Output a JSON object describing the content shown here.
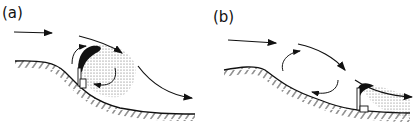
{
  "figure": {
    "panels": [
      {
        "id": "a",
        "label": "(a)",
        "description": "Stack on hillside upwind slope; plume trapped in lee recirculation eddy"
      },
      {
        "id": "b",
        "label": "(b)",
        "description": "Stack downwind of hill; plume dispersed downstream beyond recirculation eddy"
      }
    ],
    "colors": {
      "ink": "#111111",
      "background": "#ffffff"
    }
  }
}
